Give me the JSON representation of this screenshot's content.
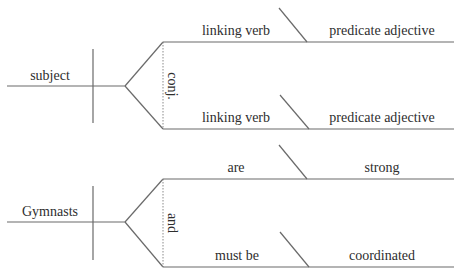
{
  "diagrams": [
    {
      "name": "template",
      "subject": "subject",
      "conjunction": "conj.",
      "branches": [
        {
          "verb": "linking verb",
          "complement": "predicate adjective"
        },
        {
          "verb": "linking verb",
          "complement": "predicate adjective"
        }
      ]
    },
    {
      "name": "example",
      "subject": "Gymnasts",
      "conjunction": "and",
      "branches": [
        {
          "verb": "are",
          "complement": "strong"
        },
        {
          "verb": "must be",
          "complement": "coordinated"
        }
      ]
    }
  ],
  "colors": {
    "line": "#6a6a6a",
    "text": "#2e2e2e"
  }
}
